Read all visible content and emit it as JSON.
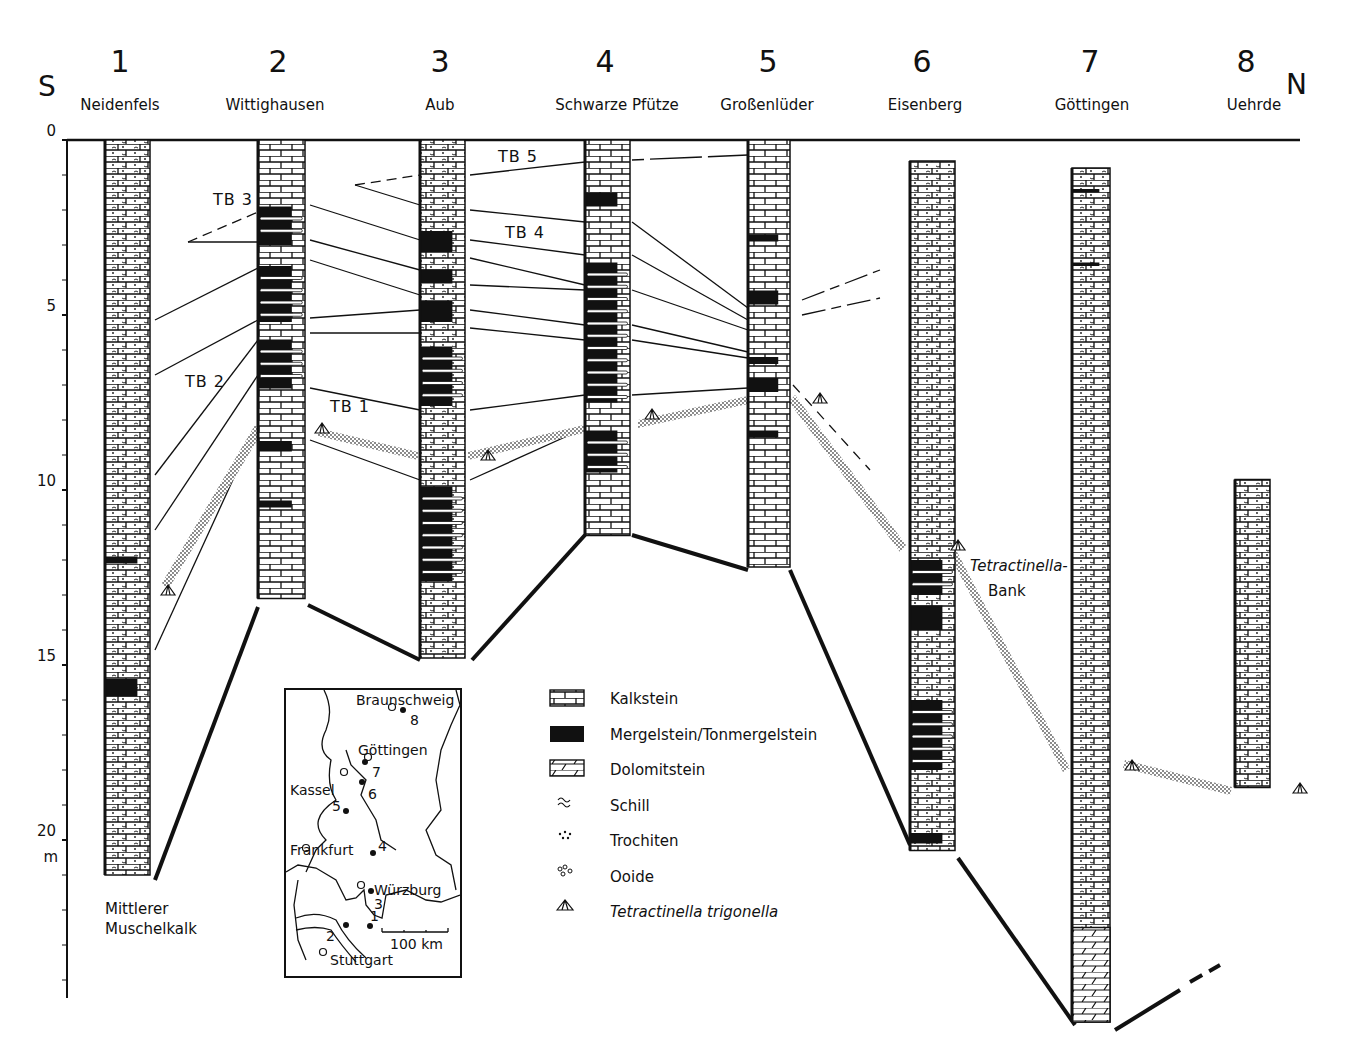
{
  "figure": {
    "direction_left": "S",
    "direction_right": "N",
    "depth_axis": {
      "unit": "m",
      "ticks": [
        0,
        5,
        10,
        15,
        20
      ],
      "range_m": [
        0,
        24.5
      ]
    },
    "sections": [
      {
        "number": "1",
        "name": "Neidenfels",
        "top_m": 0,
        "base_m": 21.0,
        "marl_bands_m": [
          [
            11.9,
            12.1
          ],
          [
            15.4,
            15.9
          ]
        ]
      },
      {
        "number": "2",
        "name": "Wittighausen",
        "top_m": 0,
        "base_m": 13.1,
        "marl_bands_m": [
          [
            1.9,
            3.0
          ],
          [
            3.6,
            5.2
          ],
          [
            5.7,
            7.1
          ],
          [
            8.6,
            8.9
          ],
          [
            10.3,
            10.5
          ]
        ]
      },
      {
        "number": "3",
        "name": "Aub",
        "top_m": 0,
        "base_m": 14.8,
        "marl_bands_m": [
          [
            2.6,
            3.2
          ],
          [
            3.7,
            4.1
          ],
          [
            4.6,
            5.2
          ],
          [
            5.9,
            7.6
          ],
          [
            9.9,
            12.6
          ]
        ]
      },
      {
        "number": "4",
        "name": "Schwarze Pfütze",
        "top_m": 0,
        "base_m": 11.3,
        "marl_bands_m": [
          [
            1.5,
            1.9
          ],
          [
            3.5,
            7.5
          ],
          [
            8.3,
            9.5
          ]
        ]
      },
      {
        "number": "5",
        "name": "Großenlüder",
        "top_m": 0,
        "base_m": 12.2,
        "marl_bands_m": [
          [
            2.7,
            2.9
          ],
          [
            4.3,
            4.7
          ],
          [
            6.2,
            6.4
          ],
          [
            6.8,
            7.2
          ],
          [
            8.3,
            8.5
          ]
        ]
      },
      {
        "number": "6",
        "name": "Eisenberg",
        "top_m": 0.6,
        "base_m": 20.3,
        "marl_bands_m": [
          [
            12.0,
            13.0
          ],
          [
            13.3,
            14.0
          ],
          [
            16.0,
            18.0
          ],
          [
            19.8,
            20.1
          ]
        ]
      },
      {
        "number": "7",
        "name": "Göttingen",
        "top_m": 0.8,
        "base_m": 25.2,
        "marl_bands_m": [
          [
            1.4,
            1.5
          ],
          [
            3.5,
            3.6
          ]
        ]
      },
      {
        "number": "8",
        "name": "Uehrde",
        "top_m": 9.7,
        "base_m": 18.5,
        "marl_bands_m": []
      }
    ],
    "bed_labels": [
      "TB 1",
      "TB 2",
      "TB 3",
      "TB 4",
      "TB 5"
    ],
    "annotations": {
      "base_unit_line1": "Mittlerer",
      "base_unit_line2": "Muschelkalk",
      "marker_bed_line1": "Tetractinella-",
      "marker_bed_line2": "Bank"
    },
    "legend": [
      {
        "icon": "limestone-pattern",
        "label": "Kalkstein"
      },
      {
        "icon": "marl-pattern",
        "label": "Mergelstein/Tonmergelstein"
      },
      {
        "icon": "dolomite-pattern",
        "label": "Dolomitstein"
      },
      {
        "icon": "shell-hash-symbol",
        "label": "Schill"
      },
      {
        "icon": "crinoid-symbol",
        "label": "Trochiten"
      },
      {
        "icon": "ooid-symbol",
        "label": "Ooide"
      },
      {
        "icon": "brachiopod-symbol",
        "label": "Tetractinella trigonella"
      }
    ],
    "inset_map": {
      "cities": [
        "Braunschweig",
        "Göttingen",
        "Kassel",
        "Frankfurt",
        "Würzburg",
        "Stuttgart"
      ],
      "site_numbers": [
        "1",
        "2",
        "3",
        "4",
        "5",
        "6",
        "7",
        "8"
      ],
      "scale_label": "100 km"
    },
    "colors": {
      "ink": "#111111",
      "paper": "#ffffff",
      "stipple": "#888888"
    }
  }
}
